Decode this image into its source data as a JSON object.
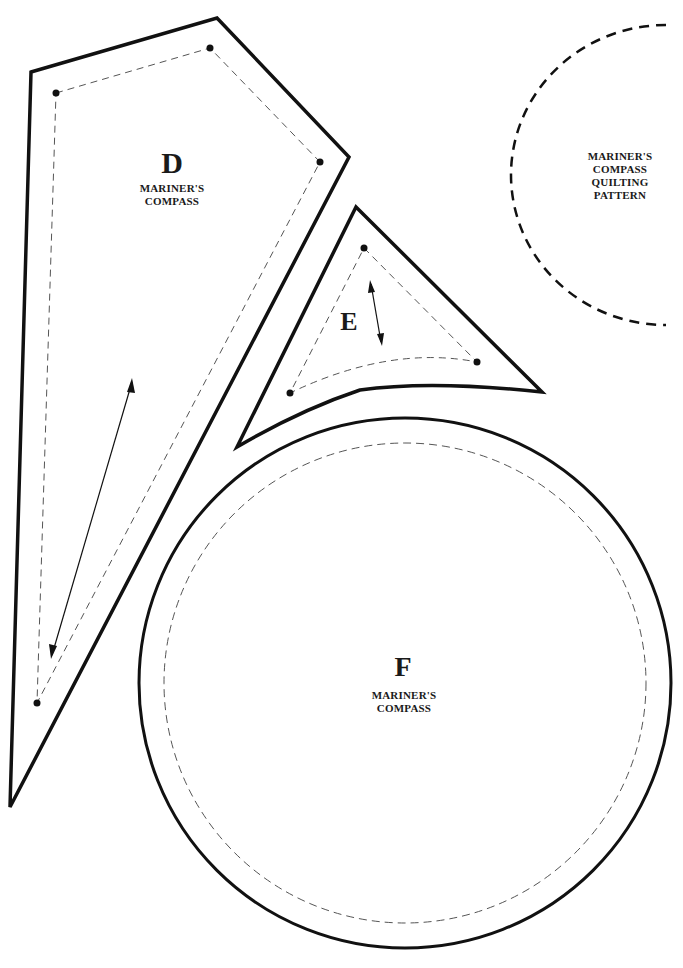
{
  "pieces": {
    "d": {
      "letter": "D",
      "line1": "MARINER'S",
      "line2": "COMPASS"
    },
    "e": {
      "letter": "E"
    },
    "f": {
      "letter": "F",
      "line1": "MARINER'S",
      "line2": "COMPASS"
    },
    "quilting": {
      "line1": "MARINER'S",
      "line2": "COMPASS",
      "line3": "QUILTING",
      "line4": "PATTERN"
    }
  },
  "colors": {
    "stroke": "#111111",
    "dash": "#555555",
    "background": "#ffffff"
  }
}
